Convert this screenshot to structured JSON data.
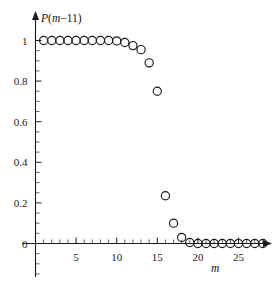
{
  "chart_data": {
    "type": "scatter",
    "title": "",
    "subtitle": "",
    "xlabel": "m",
    "ylabel": "P(m-1)",
    "ylabel_parts": {
      "fn": "P",
      "open": "(",
      "var": "m",
      "minus": "−1",
      "one": "1",
      "close": ")"
    },
    "x": [
      1,
      2,
      3,
      4,
      5,
      6,
      7,
      8,
      9,
      10,
      11,
      12,
      13,
      14,
      15,
      16,
      17,
      18,
      19,
      20,
      21,
      22,
      23,
      24,
      25,
      26,
      27,
      28
    ],
    "values": [
      1.0,
      1.0,
      1.0,
      1.0,
      1.0,
      1.0,
      1.0,
      1.0,
      1.0,
      0.998,
      0.99,
      0.975,
      0.955,
      0.89,
      0.75,
      0.235,
      0.1,
      0.03,
      0.005,
      0.0,
      0.0,
      0.0,
      0.0,
      0.0,
      0.0,
      0.0,
      0.0,
      0.0
    ],
    "series": [
      {
        "name": "P(m-1)",
        "marker": "open-circle",
        "values": [
          1.0,
          1.0,
          1.0,
          1.0,
          1.0,
          1.0,
          1.0,
          1.0,
          1.0,
          0.998,
          0.99,
          0.975,
          0.955,
          0.89,
          0.75,
          0.235,
          0.1,
          0.03,
          0.005,
          0.0,
          0.0,
          0.0,
          0.0,
          0.0,
          0.0,
          0.0,
          0.0,
          0.0
        ]
      }
    ],
    "xlim": [
      0,
      29
    ],
    "ylim": [
      -0.06,
      1.06
    ],
    "xticks": [
      5,
      10,
      15,
      20,
      25
    ],
    "xtick_labels": [
      "5",
      "10",
      "15",
      "20",
      "25"
    ],
    "yticks": [
      0,
      0.2,
      0.4,
      0.6,
      0.8,
      1
    ],
    "ytick_labels": [
      "0",
      "0.2",
      "0.4",
      "0.6",
      "0.8",
      "1"
    ],
    "x_minor_step": 1,
    "y_minor_step": 0.05,
    "grid": false,
    "legend": null,
    "axis_style": "arrow-axes",
    "marker_color": "#1a1a1a",
    "axis_color": "#1a1a1a"
  }
}
